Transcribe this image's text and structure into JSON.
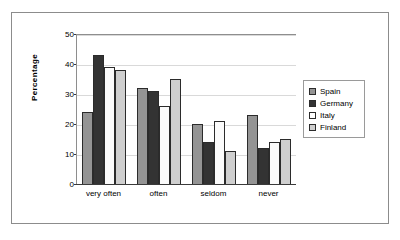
{
  "chart_data": {
    "type": "bar",
    "title": "",
    "xlabel": "",
    "ylabel": "Percentage",
    "ylim": [
      0,
      50
    ],
    "ytick_step": 10,
    "yticks": [
      50,
      40,
      30,
      20,
      10,
      0
    ],
    "grid": true,
    "legend_position": "right",
    "categories": [
      "very often",
      "often",
      "seldom",
      "never"
    ],
    "series": [
      {
        "name": "Spain",
        "color": "#949494",
        "values": [
          24,
          32,
          20,
          23
        ]
      },
      {
        "name": "Germany",
        "color": "#333333",
        "values": [
          43,
          31,
          14,
          12
        ]
      },
      {
        "name": "Italy",
        "color": "#fbfbfb",
        "values": [
          39,
          26,
          21,
          14
        ]
      },
      {
        "name": "Finland",
        "color": "#cfcfcf",
        "values": [
          38,
          35,
          11,
          15
        ]
      }
    ]
  },
  "colors": {
    "frame_border": "#8c8c8c",
    "axis": "#3a3a3a",
    "gridline": "#d9d9d9",
    "bar_outline": "#2b2b2b",
    "background": "#ffffff"
  }
}
